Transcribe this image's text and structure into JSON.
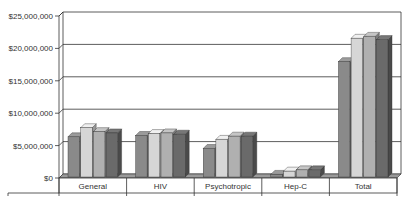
{
  "chart_data": {
    "type": "bar",
    "style": "3d-clustered-column",
    "title": "",
    "xlabel": "",
    "ylabel": "",
    "categories": [
      "General",
      "HIV",
      "Psychotropic",
      "Hep-C",
      "Total"
    ],
    "series": [
      {
        "name": "Series 1",
        "color": "#8a8a8a",
        "values": [
          6200000,
          6400000,
          4400000,
          400000,
          17800000
        ]
      },
      {
        "name": "Series 2",
        "color": "#d6d6d6",
        "values": [
          7600000,
          6700000,
          5800000,
          900000,
          21400000
        ]
      },
      {
        "name": "Series 3",
        "color": "#b0b0b0",
        "values": [
          7000000,
          6800000,
          6300000,
          1100000,
          21700000
        ]
      },
      {
        "name": "Series 4",
        "color": "#6a6a6a",
        "values": [
          6800000,
          6600000,
          6300000,
          1100000,
          21200000
        ]
      }
    ],
    "yticks": [
      "$0",
      "$5,000,000",
      "$10,000,000",
      "$15,000,000",
      "$20,000,000",
      "$25,000,000"
    ],
    "ylim": [
      0,
      25000000
    ],
    "grid": true,
    "legend": "none"
  }
}
